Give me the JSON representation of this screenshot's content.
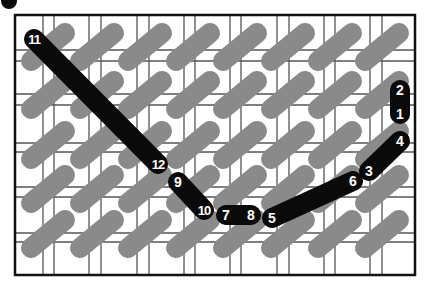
{
  "diagram": {
    "type": "stitch-diagram",
    "canvas": {
      "width": 424,
      "height": 282
    },
    "colors": {
      "background": "#ffffff",
      "grid_line": "#555555",
      "frame": "#111111",
      "stitch_gray": "#8a8a8a",
      "thread_black": "#0a0a0a",
      "label_text": "#ffffff"
    },
    "corner_dot": {
      "cx": 9,
      "cy": 1,
      "r": 8
    },
    "frame": {
      "x": 15,
      "y": 15,
      "width": 400,
      "height": 260
    },
    "grid": {
      "vertical_pairs": [
        [
          43,
          54
        ],
        [
          89,
          101
        ],
        [
          137,
          149
        ],
        [
          184,
          195
        ],
        [
          230,
          241
        ],
        [
          277,
          289
        ],
        [
          324,
          335
        ],
        [
          370,
          382
        ]
      ],
      "horizontal_pairs": [
        [
          50,
          61
        ],
        [
          94,
          105
        ],
        [
          143,
          152
        ],
        [
          187,
          197
        ],
        [
          233,
          242
        ]
      ]
    },
    "background_stitches": {
      "rows_center_y": [
        47,
        95,
        145,
        189,
        234
      ],
      "cols_center_x": [
        48,
        97,
        145,
        193,
        240,
        288,
        335,
        382
      ],
      "dx": 17,
      "dy": 14,
      "width": 20
    },
    "thread_width": 20,
    "nodes": [
      {
        "id": "1",
        "label": "1",
        "x": 400,
        "y": 114
      },
      {
        "id": "2",
        "label": "2",
        "x": 400,
        "y": 90
      },
      {
        "id": "3",
        "label": "3",
        "x": 369,
        "y": 171
      },
      {
        "id": "4",
        "label": "4",
        "x": 400,
        "y": 141
      },
      {
        "id": "5",
        "label": "5",
        "x": 272,
        "y": 218
      },
      {
        "id": "6",
        "label": "6",
        "x": 353,
        "y": 181
      },
      {
        "id": "7",
        "label": "7",
        "x": 226,
        "y": 215
      },
      {
        "id": "8",
        "label": "8",
        "x": 251,
        "y": 215
      },
      {
        "id": "9",
        "label": "9",
        "x": 178,
        "y": 182
      },
      {
        "id": "10",
        "label": "10",
        "x": 204,
        "y": 210
      },
      {
        "id": "11",
        "label": "11",
        "x": 34,
        "y": 39
      },
      {
        "id": "12",
        "label": "12",
        "x": 158,
        "y": 164
      }
    ],
    "thread_segments": [
      {
        "from": "1",
        "to": "2"
      },
      {
        "from": "3",
        "to": "4"
      },
      {
        "from": "5",
        "to": "6"
      },
      {
        "from": "7",
        "to": "8"
      },
      {
        "from": "9",
        "to": "10"
      },
      {
        "from": "11",
        "to": "12"
      }
    ]
  }
}
